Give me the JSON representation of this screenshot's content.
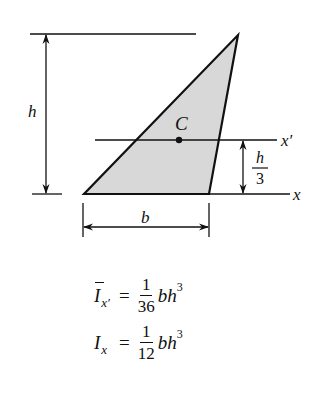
{
  "diagram": {
    "shape": "triangle",
    "vertices": {
      "bottom_left": [
        84,
        194
      ],
      "bottom_right": [
        209,
        194
      ],
      "apex": [
        238,
        35
      ]
    },
    "fill_color": "#d8d8d8",
    "stroke_color": "#111111",
    "labels": {
      "height": "h",
      "base": "b",
      "centroid": "C",
      "centroidal_axis": "x′",
      "base_axis": "x",
      "offset_numerator": "h",
      "offset_denominator": "3"
    }
  },
  "formulas": [
    {
      "symbol": "I",
      "overbar": true,
      "subscript": "x′",
      "equals": "=",
      "numerator": "1",
      "denominator": "36",
      "expression": "bh",
      "exponent": "3"
    },
    {
      "symbol": "I",
      "overbar": false,
      "subscript": "x",
      "equals": "=",
      "numerator": "1",
      "denominator": "12",
      "expression": "bh",
      "exponent": "3"
    }
  ]
}
